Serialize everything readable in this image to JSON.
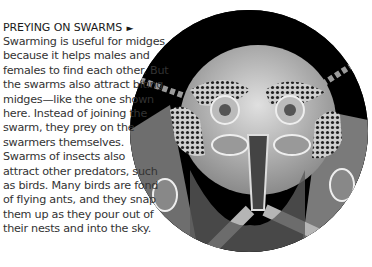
{
  "article": {
    "heading": "PREYING ON SWARMS",
    "heading_icon": "triangle-right-icon",
    "heading_arrow": "►",
    "paragraphs": [
      "Swarming is useful for midges\nbecause it helps males and\nfemales to find each other. But\nthe swarms also attract biting\nmidges—like the one shown\nhere. Instead of joining the\nswarm, they prey on the\nswarmers themselves.",
      "Swarms of insects also\nattract other predators, such\nas birds. Many birds are fond\nof flying ants, and they snap\nthem up as they pour out of\ntheir nests and into the sky."
    ]
  },
  "image": {
    "subject": "electron micrograph of a biting midge head",
    "shape": "circle",
    "colors": {
      "background": "#000000",
      "insect": "#bdbdbd"
    }
  }
}
